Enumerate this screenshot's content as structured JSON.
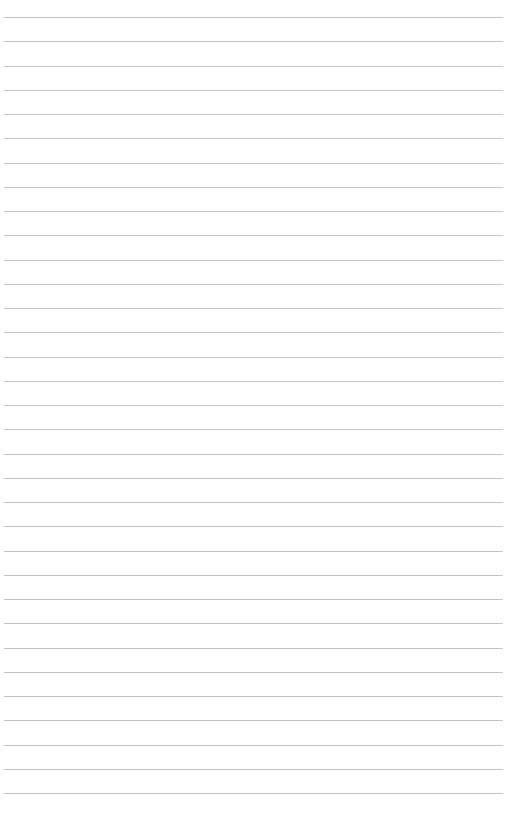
{
  "page": {
    "type": "lined-paper",
    "background_color": "#ffffff",
    "line_color": "#c4c4c4",
    "line_count": 33,
    "first_line_y": 17,
    "line_spacing": 24.25,
    "line_left": 4,
    "line_width": 499,
    "text": ""
  }
}
